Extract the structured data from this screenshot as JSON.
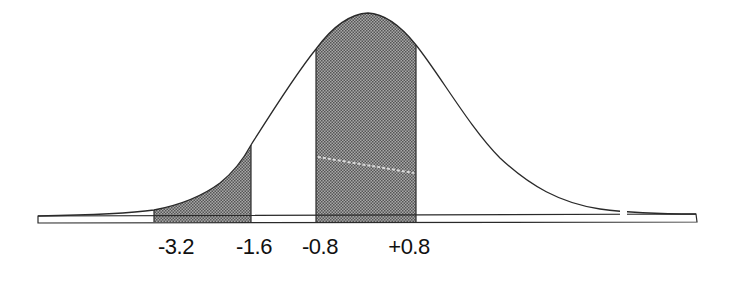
{
  "figure": {
    "colors": {
      "line": "#2a2a2a",
      "shade": "#8c8c8c",
      "background": "#ffffff"
    }
  },
  "axis": {
    "labels": [
      {
        "text": "-3.2",
        "x": 176
      },
      {
        "text": "-1.6",
        "x": 254
      },
      {
        "text": "-0.8",
        "x": 320
      },
      {
        "text": "+0.8",
        "x": 409
      }
    ]
  },
  "regions": [
    {
      "name": "left-tail-region",
      "from": "-3.2",
      "to": "-1.6",
      "shaded": true
    },
    {
      "name": "central-region",
      "from": "-0.8",
      "to": "+0.8",
      "shaded": true
    }
  ]
}
